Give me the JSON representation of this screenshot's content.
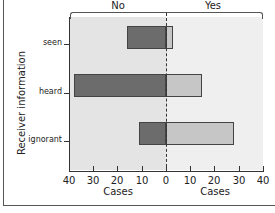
{
  "chart_data": {
    "type": "bar",
    "orientation": "horizontal",
    "layout": "diverging",
    "title": "",
    "ylabel": "Receiver information",
    "xlabel_left": "Cases",
    "xlabel_right": "Cases",
    "groups": [
      "No",
      "Yes"
    ],
    "categories": [
      "seen",
      "heard",
      "ignorant"
    ],
    "series": [
      {
        "name": "No",
        "values": [
          16,
          38,
          11
        ],
        "color": "#6c6c6c",
        "direction": "left"
      },
      {
        "name": "Yes",
        "values": [
          3,
          15,
          28
        ],
        "color": "#c6c6c6",
        "direction": "right"
      }
    ],
    "xlim_left": [
      40,
      0
    ],
    "xlim_right": [
      0,
      40
    ],
    "xticks": [
      "40",
      "30",
      "20",
      "10",
      "0",
      "10",
      "20",
      "30",
      "40"
    ],
    "grid": false,
    "legend": "none (group labels above panels)"
  },
  "labels": {
    "group_no": "No",
    "group_yes": "Yes",
    "ylabel": "Receiver information",
    "xlabel_left": "Cases",
    "xlabel_right": "Cases",
    "categories": [
      "seen",
      "heard",
      "ignorant"
    ],
    "xticks": [
      "40",
      "30",
      "20",
      "10",
      "0",
      "10",
      "20",
      "30",
      "40"
    ]
  },
  "colors": {
    "no_bar": "#6c6c6c",
    "yes_bar": "#c6c6c6",
    "panel_left": "#e4e4e4",
    "panel_right": "#efefef"
  }
}
